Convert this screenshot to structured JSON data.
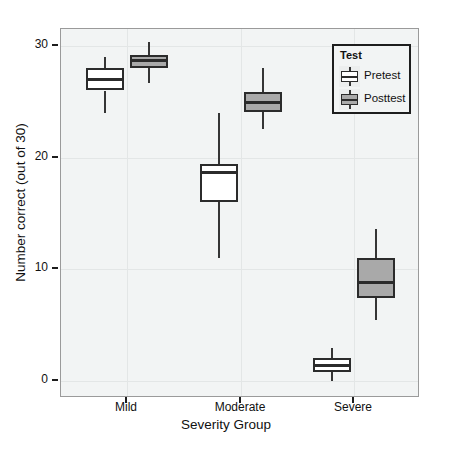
{
  "chart_data": {
    "type": "box",
    "title": "",
    "xlabel": "Severity Group",
    "ylabel": "Number correct (out of 30)",
    "categories": [
      "Mild",
      "Moderate",
      "Severe"
    ],
    "ylim": [
      -1.5,
      31.5
    ],
    "yticks": [
      0,
      10,
      20,
      30
    ],
    "ytick_labels": [
      "0",
      "10",
      "20",
      "30"
    ],
    "grid": true,
    "legend": {
      "title": "Test",
      "position": "top-right",
      "entries": [
        {
          "label": "Pretest",
          "color": "#ffffff"
        },
        {
          "label": "Posttest",
          "color": "#a9a9a9"
        }
      ]
    },
    "series": [
      {
        "name": "Pretest",
        "color": "#ffffff",
        "boxes": [
          {
            "category": "Mild",
            "whisker_low": 24.0,
            "q1": 26.0,
            "median": 27.0,
            "q3": 28.0,
            "whisker_high": 29.0
          },
          {
            "category": "Moderate",
            "whisker_low": 11.0,
            "q1": 16.0,
            "median": 18.7,
            "q3": 19.4,
            "whisker_high": 24.0
          },
          {
            "category": "Severe",
            "whisker_low": 0.0,
            "q1": 0.8,
            "median": 1.4,
            "q3": 2.1,
            "whisker_high": 3.0
          }
        ]
      },
      {
        "name": "Posttest",
        "color": "#a9a9a9",
        "boxes": [
          {
            "category": "Mild",
            "whisker_low": 26.7,
            "q1": 28.0,
            "median": 28.7,
            "q3": 29.2,
            "whisker_high": 30.3
          },
          {
            "category": "Moderate",
            "whisker_low": 22.6,
            "q1": 24.1,
            "median": 24.9,
            "q3": 25.9,
            "whisker_high": 28.0
          },
          {
            "category": "Severe",
            "whisker_low": 5.5,
            "q1": 7.4,
            "median": 8.8,
            "q3": 11.0,
            "whisker_high": 13.6
          }
        ]
      }
    ]
  }
}
